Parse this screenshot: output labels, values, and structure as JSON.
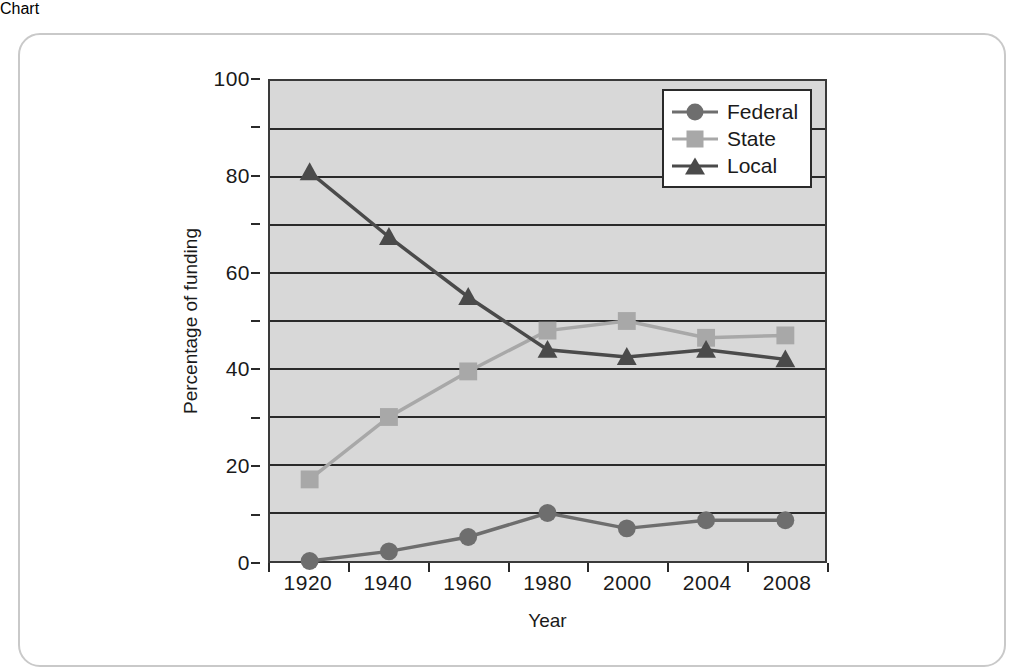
{
  "chart_data": {
    "type": "line",
    "title": "",
    "xlabel": "Year",
    "ylabel": "Percentage of funding",
    "categories": [
      "1920",
      "1940",
      "1960",
      "1980",
      "2000",
      "2004",
      "2008"
    ],
    "series": [
      {
        "name": "Federal",
        "marker": "circle",
        "color": "#6e6e6e",
        "values": [
          0,
          2,
          5,
          10,
          6.8,
          8.5,
          8.5
        ]
      },
      {
        "name": "State",
        "marker": "square",
        "color": "#a8a8a8",
        "values": [
          17,
          30,
          39.5,
          48,
          50,
          46.5,
          47
        ]
      },
      {
        "name": "Local",
        "marker": "triangle",
        "color": "#4a4a4a",
        "values": [
          81,
          67.5,
          55,
          44,
          42.5,
          44,
          42
        ]
      }
    ],
    "ylim": [
      0,
      100
    ],
    "y_tick_labels": [
      "0",
      "20",
      "40",
      "60",
      "80",
      "100"
    ],
    "y_tick_values": [
      0,
      20,
      40,
      60,
      80,
      100
    ],
    "y_gridline_values": [
      0,
      10,
      20,
      30,
      40,
      50,
      60,
      70,
      80,
      90,
      100
    ],
    "grid": "horizontal",
    "legend_position": "upper-right",
    "plot_background": "#d8d8d8",
    "frame_color": "#c9c9c9",
    "axis_color": "#2a2a2a"
  },
  "legend": {
    "items": [
      {
        "label": "Federal"
      },
      {
        "label": "State"
      },
      {
        "label": "Local"
      }
    ]
  }
}
